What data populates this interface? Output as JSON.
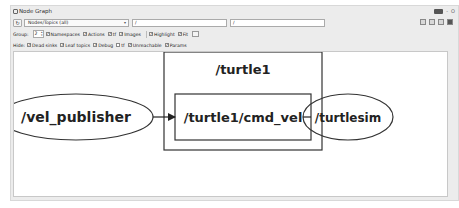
{
  "window": {
    "title": "Node Graph",
    "controls": [
      "DGP",
      "-",
      "O"
    ]
  },
  "toolbar": {
    "refresh_icon": "refresh-icon",
    "graph_type_selected": "Nodes/Topics (all)",
    "node_filter_value": "/",
    "topic_filter_value": "/",
    "right_tools": [
      "load-dot-icon",
      "save-dot-icon",
      "save-svg-icon",
      "save-image-icon"
    ]
  },
  "options": {
    "group_label": "Group:",
    "group_value": "2",
    "checkboxes": [
      {
        "label": "Namespaces",
        "checked": true
      },
      {
        "label": "Actions",
        "checked": true
      },
      {
        "label": "tf",
        "checked": true
      },
      {
        "label": "Images",
        "checked": true
      },
      {
        "label": "Highlight",
        "checked": true
      },
      {
        "label": "Fit",
        "checked": true
      }
    ]
  },
  "hide": {
    "label": "Hide:",
    "checkboxes": [
      {
        "label": "Dead sinks",
        "checked": true
      },
      {
        "label": "Leaf topics",
        "checked": true
      },
      {
        "label": "Debug",
        "checked": true
      },
      {
        "label": "tf",
        "checked": false
      },
      {
        "label": "Unreachable",
        "checked": true
      },
      {
        "label": "Params",
        "checked": true
      }
    ]
  },
  "graph": {
    "namespace_label": "/turtle1",
    "nodes": [
      {
        "id": "vel_publisher",
        "label": "/vel_publisher",
        "shape": "ellipse"
      },
      {
        "id": "turtlesim",
        "label": "/turtlesim",
        "shape": "ellipse"
      }
    ],
    "topics": [
      {
        "id": "cmd_vel",
        "label": "/turtle1/cmd_vel",
        "shape": "box"
      }
    ],
    "edges": [
      {
        "from": "/vel_publisher",
        "to": "/turtle1/cmd_vel"
      },
      {
        "from": "/turtle1/cmd_vel",
        "to": "/turtlesim"
      }
    ]
  }
}
